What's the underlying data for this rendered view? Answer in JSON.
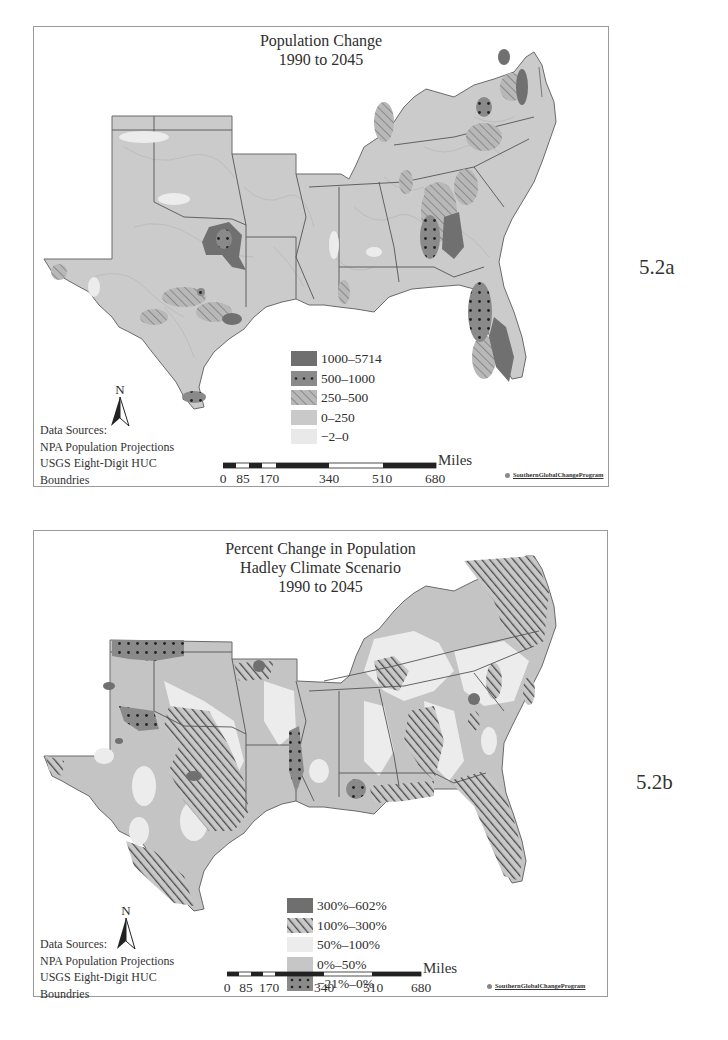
{
  "figures": [
    {
      "label": "5.2a",
      "title_lines": [
        "Population Change",
        "1990 to 2045"
      ],
      "legend": [
        {
          "label": "1000–5714",
          "pattern": "solid-dark",
          "color": "#6f6f6f"
        },
        {
          "label": "500–1000",
          "pattern": "dots",
          "color": "#8a8a8a"
        },
        {
          "label": "250–500",
          "pattern": "hatch-light",
          "color": "#a8a8a8"
        },
        {
          "label": "0–250",
          "pattern": "solid",
          "color": "#c9c9c9"
        },
        {
          "label": "−2–0",
          "pattern": "solid-light",
          "color": "#e9e9e9"
        }
      ],
      "north_arrow": "N",
      "sources": [
        "Data Sources:",
        "NPA Population Projections",
        "USGS Eight-Digit HUC",
        "Boundries"
      ],
      "scale": {
        "unit": "Miles",
        "ticks": [
          "0",
          "85",
          "170",
          "340",
          "510",
          "680"
        ]
      },
      "credit": "SouthernGlobalChangeProgram"
    },
    {
      "label": "5.2b",
      "title_lines": [
        "Percent Change in Population",
        "Hadley Climate Scenario",
        "1990 to 2045"
      ],
      "legend": [
        {
          "label": "300%–602%",
          "pattern": "solid-dark",
          "color": "#6f6f6f"
        },
        {
          "label": "100%–300%",
          "pattern": "hatch-dark",
          "color": "#8f8f8f"
        },
        {
          "label": "50%–100%",
          "pattern": "solid-light",
          "color": "#ececec"
        },
        {
          "label": "0%–50%",
          "pattern": "solid",
          "color": "#c6c6c6"
        },
        {
          "label": "−21%–0%",
          "pattern": "dots",
          "color": "#8a8a8a"
        }
      ],
      "north_arrow": "N",
      "sources": [
        "Data Sources:",
        "NPA Population Projections",
        "USGS Eight-Digit HUC",
        "Boundries"
      ],
      "scale": {
        "unit": "Miles",
        "ticks": [
          "0",
          "85",
          "170",
          "340",
          "510",
          "680"
        ]
      },
      "credit": "SouthernGlobalChangeProgram"
    }
  ],
  "colors": {
    "frame_border": "#9a9a9a",
    "state_border": "#555555",
    "map_base_a": "#cbcbcb",
    "map_base_b": "#c4c4c4"
  }
}
